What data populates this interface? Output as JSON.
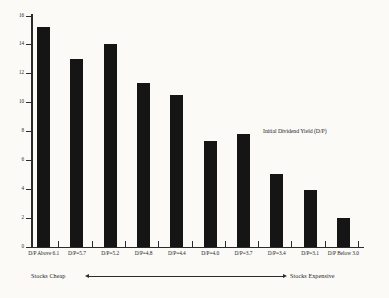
{
  "chart_data": {
    "type": "bar",
    "title": "",
    "subtitle": "",
    "xlabel": "",
    "ylabel": "",
    "categories": [
      "D/P Above 6.1",
      "D/P=5.7",
      "D/P=5.2",
      "D/P=4.8",
      "D/P=4.4",
      "D/P=4.0",
      "D/P=3.7",
      "D/P=3.4",
      "D/P=3.1",
      "D/P Below 3.0"
    ],
    "values": [
      15.2,
      13.0,
      14.0,
      11.3,
      10.5,
      7.3,
      7.8,
      5.0,
      3.9,
      2.0
    ],
    "ylim": [
      0,
      16
    ],
    "ytick_labels": [
      "16",
      "14",
      "12",
      "10",
      "8",
      "6",
      "4",
      "2",
      "0"
    ],
    "ytick_values": [
      16,
      14,
      12,
      10,
      8,
      6,
      4,
      2,
      0
    ],
    "grid": false,
    "legend": "none",
    "annotations": [
      {
        "text": "Initial Dividend Yield (D/P)",
        "position": "upper-right"
      }
    ],
    "axis_note": {
      "left_label": "Stocks Cheap",
      "right_label": "Stocks Expensive",
      "arrow": "double-headed"
    },
    "bar_color": "#151515",
    "axis_color": "#2b2b2b",
    "background_color": "#fbfaf7"
  },
  "corner": {
    "faint_label": ""
  }
}
